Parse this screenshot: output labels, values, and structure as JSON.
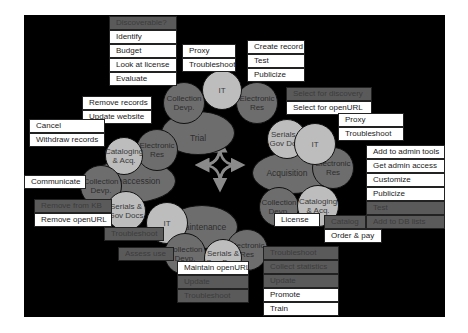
{
  "diagram": {
    "center_arrows": "four-way curved arrows connecting stages",
    "colors": {
      "background": "#000000",
      "dark_node": "#6d6d6d",
      "light_node": "#bdbdbd",
      "white_label": "#ffffff",
      "gray_label": "#5a5a5a",
      "arrow": "#8a8a8a"
    },
    "stages": {
      "trial": {
        "label": "Trial",
        "nodes": {
          "collection": "Collection Devp.",
          "it": "IT",
          "electronic": "Electronic Res"
        },
        "tasks_collection": [
          "Discoverable?",
          "Identify",
          "Budget",
          "Look at license",
          "Evaluate"
        ],
        "tasks_it": [
          "Proxy",
          "Troubleshoot"
        ],
        "tasks_electronic": [
          "Create record",
          "Test",
          "Publicize"
        ]
      },
      "acquisition": {
        "label": "Acquisition",
        "nodes": {
          "serials": "Serials & Gov Docs",
          "it": "IT",
          "electronic": "Electronic Res",
          "collection": "Collection Devp.",
          "cataloging": "Cataloging & Acq."
        },
        "tasks_serials": [
          "Select for discovery",
          "Select for openURL"
        ],
        "tasks_it": [
          "Proxy",
          "Troubleshoot"
        ],
        "tasks_electronic": [
          "Add to admin tools",
          "Get admin access",
          "Customize",
          "Publicize",
          "Test",
          "Add to DB lists"
        ],
        "tasks_collection": [
          "License"
        ],
        "tasks_cataloging": [
          "Catalog",
          "Order & pay"
        ]
      },
      "maintenance": {
        "label": "Maintenance",
        "nodes": {
          "it": "IT",
          "collection": "Collection Devp.",
          "serials": "Serials & Gov Docs",
          "electronic": "Electronic Res"
        },
        "tasks_it": [
          "Troubleshoot"
        ],
        "tasks_collection": [
          "Assess use"
        ],
        "tasks_serials": [
          "Maintain openURL",
          "Update",
          "Troubleshoot"
        ],
        "tasks_electronic": [
          "Troubleshoot",
          "Collect statistics",
          "Update",
          "Promote",
          "Train"
        ]
      },
      "deaccession": {
        "label": "Deaccession",
        "nodes": {
          "cataloging": "Cataloging & Acq.",
          "electronic": "Electronic Res",
          "collection": "Collection Devp.",
          "serials": "Serials & Gov Docs"
        },
        "tasks_electronic": [
          "Remove records",
          "Update website"
        ],
        "tasks_cataloging": [
          "Cancel",
          "Withdraw records"
        ],
        "tasks_collection": [
          "Communicate"
        ],
        "tasks_serials": [
          "Remove from KB",
          "Remove  openURL"
        ]
      }
    }
  }
}
